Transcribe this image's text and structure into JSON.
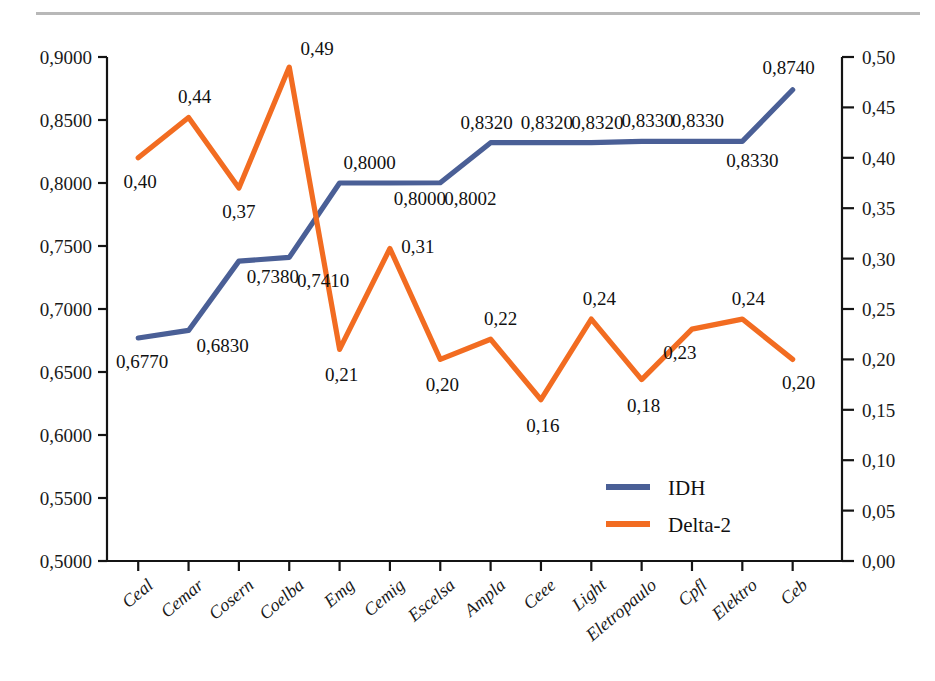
{
  "chart_data": {
    "type": "line",
    "title": "",
    "subtitle": "",
    "xlabel": "",
    "ylabel": "",
    "grid": false,
    "legend_position": "center-right",
    "categories": [
      "Ceal",
      "Cemar",
      "Cosern",
      "Coelba",
      "Emg",
      "Cemig",
      "Escelsa",
      "Ampla",
      "Ceee",
      "Light",
      "Eletropaulo",
      "Cpfl",
      "Elektro",
      "Ceb"
    ],
    "series": [
      {
        "name": "IDH",
        "axis": "left",
        "color": "#4A5F96",
        "values": [
          0.677,
          0.683,
          0.738,
          0.741,
          0.8,
          0.8,
          0.8002,
          0.832,
          0.832,
          0.832,
          0.833,
          0.833,
          0.833,
          0.874
        ],
        "labels": [
          "0,6770",
          "0,6830",
          "0,7380",
          "0,7410",
          "0,8000",
          "0,8000",
          "0,8002",
          "0,8320",
          "0,8320",
          "0,8320",
          "0,8330",
          "0,8330",
          "0,8330",
          "0,8740"
        ]
      },
      {
        "name": "Delta-2",
        "axis": "right",
        "color": "#F26C21",
        "values": [
          0.4,
          0.44,
          0.37,
          0.49,
          0.21,
          0.31,
          0.2,
          0.22,
          0.16,
          0.24,
          0.18,
          0.23,
          0.24,
          0.2
        ],
        "labels": [
          "0,40",
          "0,44",
          "0,37",
          "0,49",
          "0,21",
          "0,31",
          "0,20",
          "0,22",
          "0,16",
          "0,24",
          "0,18",
          "0,23",
          "0,24",
          "0,20"
        ]
      }
    ],
    "left_axis": {
      "min": 0.5,
      "max": 0.9,
      "step": 0.05,
      "tick_labels": [
        "0,9000",
        "0,8500",
        "0,8000",
        "0,7500",
        "0,7000",
        "0,6500",
        "0,6000",
        "0,5500",
        "0,5000"
      ]
    },
    "right_axis": {
      "min": 0.0,
      "max": 0.5,
      "step": 0.05,
      "tick_labels": [
        "0,50",
        "0,45",
        "0,40",
        "0,35",
        "0,30",
        "0,25",
        "0,20",
        "0,15",
        "0,10",
        "0,05",
        "0,00"
      ]
    },
    "legend": [
      {
        "label": "IDH",
        "color": "#4A5F96"
      },
      {
        "label": "Delta-2",
        "color": "#F26C21"
      }
    ]
  }
}
